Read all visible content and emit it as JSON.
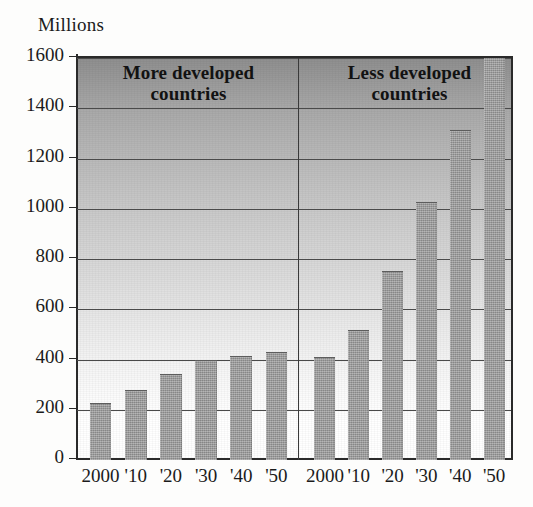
{
  "figure": {
    "y_units_label": "Millions",
    "colors": {
      "bar": "#939393",
      "axis": "#2a2a2a",
      "gridline": "#4a4a4a",
      "plot_top": "#8e8e8e",
      "plot_bottom": "#ffffff",
      "text": "#1b1b1b"
    }
  },
  "chart_data": {
    "type": "bar",
    "title": "",
    "subtitle": "",
    "xlabel": "",
    "ylabel": "Millions",
    "ylim": [
      0,
      1600
    ],
    "yticks": [
      0,
      200,
      400,
      600,
      800,
      1000,
      1200,
      1400,
      1600
    ],
    "ytick_labels": [
      "0",
      "200",
      "400",
      "600",
      "800",
      "1000",
      "1200",
      "1400",
      "1600"
    ],
    "grid": true,
    "legend_position": "panel-titles",
    "panels": [
      {
        "name": "more-developed",
        "title": "More developed countries",
        "title_lines": [
          "More developed",
          "countries"
        ],
        "categories": [
          "2000",
          "'10",
          "'20",
          "'30",
          "'40",
          "'50"
        ],
        "values": [
          225,
          275,
          340,
          395,
          410,
          425
        ]
      },
      {
        "name": "less-developed",
        "title": "Less developed countries",
        "title_lines": [
          "Less developed",
          "countries"
        ],
        "categories": [
          "2000",
          "'10",
          "'20",
          "'30",
          "'40",
          "'50"
        ],
        "values": [
          405,
          515,
          750,
          1025,
          1310,
          1640
        ]
      }
    ]
  }
}
